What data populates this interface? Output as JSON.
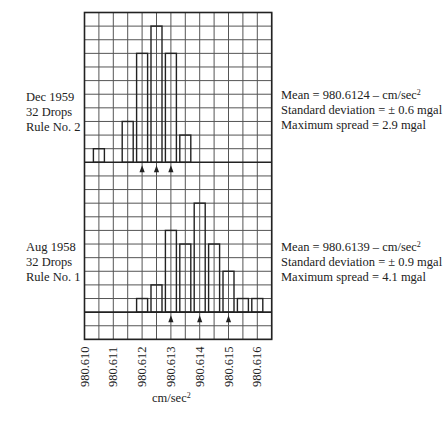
{
  "chart_data": [
    {
      "type": "bar",
      "name": "top-panel",
      "panel_label": [
        "Dec 1959",
        "32 Drops",
        "Rule No. 2"
      ],
      "stats": {
        "mean_label": "Mean = 980.6124 – cm/sec",
        "mean_sup": "2",
        "std_label": "Standard deviation = ± 0.6 mgal",
        "spread_label": "Maximum spread = 2.9 mgal"
      },
      "bin_centers": [
        980.6105,
        980.6115,
        980.612,
        980.6125,
        980.613,
        980.6135
      ],
      "counts": [
        1,
        3,
        8,
        10,
        8,
        2
      ],
      "total_drops": 32,
      "arrow_positions": [
        980.612,
        980.6125,
        980.613
      ]
    },
    {
      "type": "bar",
      "name": "bottom-panel",
      "panel_label": [
        "Aug 1958",
        "32 Drops",
        "Rule No. 1"
      ],
      "stats": {
        "mean_label": "Mean = 980.6139 – cm/sec",
        "mean_sup": "2",
        "std_label": "Standard deviation = ± 0.9 mgal",
        "spread_label": "Maximum spread = 4.1 mgal"
      },
      "bin_centers": [
        980.612,
        980.6125,
        980.613,
        980.6135,
        980.614,
        980.6145,
        980.615,
        980.6155,
        980.616
      ],
      "counts": [
        1,
        2,
        6,
        5,
        8,
        5,
        3,
        1,
        1
      ],
      "total_drops": 32,
      "arrow_positions": [
        980.613,
        980.614,
        980.615
      ]
    }
  ],
  "axis": {
    "x_ticks": [
      "980.610",
      "980.611",
      "980.612",
      "980.613",
      "980.614",
      "980.615",
      "980.616"
    ],
    "x_tick_values": [
      980.61,
      980.611,
      980.612,
      980.613,
      980.614,
      980.615,
      980.616
    ],
    "x_unit": "cm/sec",
    "x_unit_sup": "2",
    "xlim": [
      980.61,
      980.6165
    ],
    "grid": true,
    "grid_columns": 13,
    "grid_rows": 24
  },
  "layout": {
    "grid_left": 84.5,
    "grid_top": 12.5,
    "col_w": 14.4,
    "row_h": 13.62,
    "top_baseline_row": 11,
    "bottom_baseline_row": 22,
    "bar_w": 11
  },
  "colors": {
    "ink": "#222222",
    "grid": "#555555",
    "background": "#ffffff"
  }
}
